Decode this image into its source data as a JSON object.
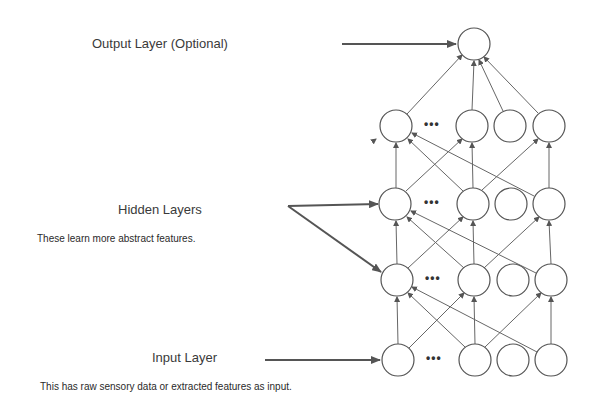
{
  "labels": {
    "output_layer": "Output Layer (Optional)",
    "hidden_layers": "Hidden Layers",
    "hidden_desc": "These learn more abstract features.",
    "input_layer": "Input Layer",
    "input_desc": "This has raw sensory data or extracted features as input."
  },
  "ellipsis": "•••",
  "colors": {
    "node_stroke": "#555555",
    "edge": "#666666",
    "pointer_arrow": "#555555",
    "text": "#3a3a3a"
  },
  "layers": [
    {
      "name": "output",
      "y": 44,
      "nodes_x": [
        474
      ]
    },
    {
      "name": "hidden-3",
      "y": 126,
      "nodes_x": [
        396,
        472,
        510,
        549
      ]
    },
    {
      "name": "hidden-2",
      "y": 204,
      "nodes_x": [
        395,
        473,
        511,
        549
      ]
    },
    {
      "name": "hidden-1",
      "y": 280,
      "nodes_x": [
        397,
        474,
        513,
        551
      ]
    },
    {
      "name": "input",
      "y": 360,
      "nodes_x": [
        398,
        475,
        513,
        551
      ]
    }
  ]
}
